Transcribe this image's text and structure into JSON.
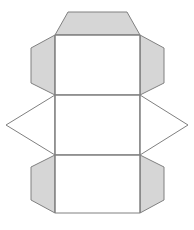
{
  "figure": {
    "title": "Net of a hexagonal prism",
    "canvas": {
      "width": 194,
      "height": 230,
      "background": "#ffffff"
    },
    "style": {
      "shaded_fill": "#d6d6d6",
      "unshaded_fill": "#ffffff",
      "stroke": "#808080",
      "stroke_width": 1
    },
    "faces": [
      {
        "name": "top-trapezoid-flap",
        "shape": "trapezoid",
        "fill": "shaded",
        "points": "68,12 127,12 140,35 55,35"
      },
      {
        "name": "upper-left-trapezoid-flap",
        "shape": "trapezoid",
        "fill": "shaded",
        "points": "55,35 55,95 31,83 31,48"
      },
      {
        "name": "upper-right-trapezoid-flap",
        "shape": "trapezoid",
        "fill": "shaded",
        "points": "140,35 164,48 164,83 140,95"
      },
      {
        "name": "upper-center-rectangle-face",
        "shape": "rectangle",
        "fill": "unshaded",
        "points": "55,35 140,35 140,95 55,95"
      },
      {
        "name": "middle-left-triangle-flap",
        "shape": "triangle",
        "fill": "unshaded",
        "points": "55,95 55,155 6,125"
      },
      {
        "name": "middle-center-rectangle-face",
        "shape": "rectangle",
        "fill": "unshaded",
        "points": "55,95 140,95 140,155 55,155"
      },
      {
        "name": "middle-right-triangle-flap",
        "shape": "triangle",
        "fill": "unshaded",
        "points": "140,95 188,125 140,155"
      },
      {
        "name": "lower-left-trapezoid-flap",
        "shape": "trapezoid",
        "fill": "shaded",
        "points": "55,155 55,213 31,200 31,167"
      },
      {
        "name": "lower-right-trapezoid-flap",
        "shape": "trapezoid",
        "fill": "shaded",
        "points": "140,155 164,167 164,200 140,213"
      },
      {
        "name": "lower-center-rectangle-face",
        "shape": "rectangle",
        "fill": "unshaded",
        "points": "55,155 140,155 140,213 55,213"
      }
    ],
    "fold_lines": [
      {
        "name": "fold-line-top",
        "x1": 55,
        "y1": 35,
        "x2": 140,
        "y2": 35
      },
      {
        "name": "fold-line-upper-middle",
        "x1": 55,
        "y1": 95,
        "x2": 140,
        "y2": 95
      },
      {
        "name": "fold-line-lower-middle",
        "x1": 55,
        "y1": 155,
        "x2": 140,
        "y2": 155
      },
      {
        "name": "fold-line-left-vertical",
        "x1": 55,
        "y1": 35,
        "x2": 55,
        "y2": 213
      },
      {
        "name": "fold-line-right-vertical",
        "x1": 140,
        "y1": 35,
        "x2": 140,
        "y2": 213
      }
    ]
  }
}
